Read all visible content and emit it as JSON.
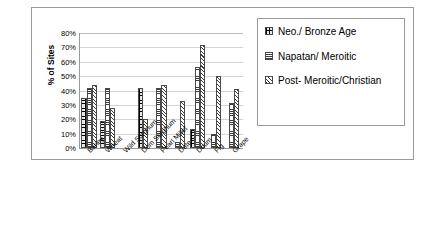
{
  "chart_data": {
    "type": "bar",
    "title": "",
    "xlabel": "",
    "ylabel": "% of Sites",
    "ylim": [
      0,
      80
    ],
    "ytick_labels": [
      "80%",
      "70%",
      "60%",
      "50%",
      "40%",
      "30%",
      "20%",
      "10%",
      "0%"
    ],
    "ytick_values": [
      80,
      70,
      60,
      50,
      40,
      30,
      20,
      10,
      0
    ],
    "grid": true,
    "legend_position": "right",
    "categories": [
      "Barley",
      "Wheat",
      "Wild Sorghum",
      "Dom Sorghum",
      "Pearl Millet",
      "Date",
      "Doum",
      "Fig",
      "Grape"
    ],
    "series": [
      {
        "name": "Neo./ Bronze Age",
        "pattern": "checker",
        "values": [
          35,
          19,
          null,
          41.5,
          null,
          null,
          13,
          null,
          null
        ]
      },
      {
        "name": "Napatan/ Meroitic",
        "pattern": "horizontal-lines",
        "values": [
          42,
          42,
          null,
          null,
          42,
          4,
          56.5,
          10,
          31
        ]
      },
      {
        "name": "Post- Meroitic/Christian",
        "pattern": "diagonal-hatch",
        "values": [
          43.5,
          28,
          null,
          20.5,
          43.5,
          32.5,
          72,
          50,
          41
        ]
      }
    ]
  },
  "legend": {
    "entries": [
      {
        "label": "Neo./ Bronze Age"
      },
      {
        "label": "Napatan/ Meroitic"
      },
      {
        "label": "Post- Meroitic/Christian"
      }
    ]
  }
}
